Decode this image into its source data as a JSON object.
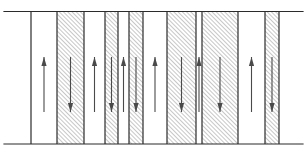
{
  "figure": {
    "width": 307,
    "height": 157,
    "background_color": "#ffffff",
    "line_color": "#2b2b2b",
    "hatch_color": "#6b6b6b",
    "arrow_color": "#4a4a4a"
  },
  "slab": {
    "top_line_y": 11.5,
    "bottom_line_y": 144.0,
    "top_line_x_start": 4,
    "top_line_x_end": 303,
    "bottom_line_x_start": 4,
    "bottom_line_x_end": 303,
    "body_x_start": 31,
    "body_x_end": 279,
    "stroke_width": 1.2
  },
  "hatch": {
    "angle_degrees": 45,
    "direction": "lower-left-to-upper-right",
    "spacing": 3.0,
    "stroke_width": 0.75,
    "color": "#6b6b6b"
  },
  "arrow": {
    "top_y": 57,
    "bottom_y": 112,
    "shaft_width": 1.1,
    "head_length": 9,
    "head_half_width": 2.6,
    "color": "#4a4a4a"
  },
  "legend": {
    "white_band_meaning": "magnetization up",
    "hatched_band_meaning": "magnetization down"
  },
  "bands": [
    {
      "id": "band-1",
      "x": 31.0,
      "width": 26.0,
      "fill": "white",
      "arrow": "up",
      "arrow_x": 44.0
    },
    {
      "id": "band-2",
      "x": 57.0,
      "width": 27.0,
      "fill": "hatched",
      "arrow": "down",
      "arrow_x": 70.5
    },
    {
      "id": "band-3",
      "x": 84.0,
      "width": 21.0,
      "fill": "white",
      "arrow": "up",
      "arrow_x": 94.5
    },
    {
      "id": "band-4",
      "x": 105.0,
      "width": 13.0,
      "fill": "hatched",
      "arrow": "down",
      "arrow_x": 111.5
    },
    {
      "id": "band-5",
      "x": 118.0,
      "width": 11.0,
      "fill": "white",
      "arrow": "up",
      "arrow_x": 123.5
    },
    {
      "id": "band-6",
      "x": 129.0,
      "width": 14.0,
      "fill": "hatched",
      "arrow": "down",
      "arrow_x": 136.0
    },
    {
      "id": "band-7",
      "x": 143.0,
      "width": 24.0,
      "fill": "white",
      "arrow": "up",
      "arrow_x": 155.0
    },
    {
      "id": "band-8",
      "x": 167.0,
      "width": 29.0,
      "fill": "hatched",
      "arrow": "down",
      "arrow_x": 181.5
    },
    {
      "id": "band-9",
      "x": 196.0,
      "width": 6.0,
      "fill": "white",
      "arrow": "up",
      "arrow_x": 199.0
    },
    {
      "id": "band-10",
      "x": 202.0,
      "width": 36.0,
      "fill": "hatched",
      "arrow": "down",
      "arrow_x": 220.0
    },
    {
      "id": "band-11",
      "x": 238.0,
      "width": 27.0,
      "fill": "white",
      "arrow": "up",
      "arrow_x": 251.5
    },
    {
      "id": "band-12",
      "x": 265.0,
      "width": 14.0,
      "fill": "hatched",
      "arrow": "down",
      "arrow_x": 272.0
    }
  ]
}
